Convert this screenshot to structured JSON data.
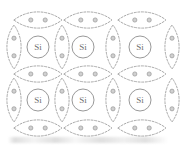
{
  "figure": {
    "kind": "silicon-crystal-lattice-covalent-bond-diagram",
    "width": 187,
    "height": 147,
    "background_color": "#ffffff",
    "line_color": "#9a9a9a",
    "line_style": "dashed",
    "atom_outline_color": "#8d8d8d",
    "electron_fill_color": "#d0d0d0",
    "electron_stroke_color": "#8a8a8a",
    "label_color": "#6f6f6f"
  },
  "atoms": [
    {
      "label": "Si",
      "cx": 38,
      "cy": 47,
      "r": 11,
      "row": 0,
      "col": 0
    },
    {
      "label": "Si",
      "cx": 83,
      "cy": 47,
      "r": 11,
      "row": 0,
      "col": 1
    },
    {
      "label": "Si",
      "cx": 140,
      "cy": 47,
      "r": 11,
      "row": 0,
      "col": 2
    },
    {
      "label": "Si",
      "cx": 38,
      "cy": 100,
      "r": 11,
      "row": 1,
      "col": 0
    },
    {
      "label": "Si",
      "cx": 83,
      "cy": 100,
      "r": 11,
      "row": 1,
      "col": 1
    },
    {
      "label": "Si",
      "cx": 140,
      "cy": 100,
      "r": 11,
      "row": 1,
      "col": 2
    }
  ],
  "horizontal_bonds": [
    {
      "cx": 38,
      "cy": 20,
      "rx": 24,
      "ry": 8,
      "electrons": 2,
      "row": "top"
    },
    {
      "cx": 88,
      "cy": 20,
      "rx": 24,
      "ry": 8,
      "electrons": 2,
      "row": "top"
    },
    {
      "cx": 142,
      "cy": 20,
      "rx": 24,
      "ry": 8,
      "electrons": 2,
      "row": "top"
    },
    {
      "cx": 38,
      "cy": 74,
      "rx": 24,
      "ry": 8,
      "electrons": 2,
      "row": "middle"
    },
    {
      "cx": 88,
      "cy": 74,
      "rx": 24,
      "ry": 8,
      "electrons": 2,
      "row": "middle"
    },
    {
      "cx": 142,
      "cy": 74,
      "rx": 24,
      "ry": 8,
      "electrons": 2,
      "row": "middle"
    },
    {
      "cx": 38,
      "cy": 128,
      "rx": 24,
      "ry": 8,
      "electrons": 2,
      "row": "bottom"
    },
    {
      "cx": 88,
      "cy": 128,
      "rx": 24,
      "ry": 8,
      "electrons": 2,
      "row": "bottom"
    },
    {
      "cx": 142,
      "cy": 128,
      "rx": 24,
      "ry": 8,
      "electrons": 2,
      "row": "bottom"
    }
  ],
  "vertical_bonds": [
    {
      "cx": 14,
      "cy": 47,
      "rx": 7,
      "ry": 22,
      "electrons": 2,
      "col": "left-edge"
    },
    {
      "cx": 62,
      "cy": 47,
      "rx": 7,
      "ry": 22,
      "electrons": 2,
      "col": "inner-1"
    },
    {
      "cx": 113,
      "cy": 47,
      "rx": 7,
      "ry": 22,
      "electrons": 2,
      "col": "inner-2"
    },
    {
      "cx": 172,
      "cy": 47,
      "rx": 7,
      "ry": 22,
      "electrons": 2,
      "col": "right-edge"
    },
    {
      "cx": 14,
      "cy": 100,
      "rx": 7,
      "ry": 22,
      "electrons": 2,
      "col": "left-edge"
    },
    {
      "cx": 62,
      "cy": 100,
      "rx": 7,
      "ry": 22,
      "electrons": 2,
      "col": "inner-1"
    },
    {
      "cx": 113,
      "cy": 100,
      "rx": 7,
      "ry": 22,
      "electrons": 2,
      "col": "inner-2"
    },
    {
      "cx": 172,
      "cy": 100,
      "rx": 7,
      "ry": 22,
      "electrons": 2,
      "col": "right-edge"
    }
  ],
  "junctions": [
    {
      "x": 14,
      "y": 20
    },
    {
      "x": 62,
      "y": 20
    },
    {
      "x": 113,
      "y": 20
    },
    {
      "x": 172,
      "y": 20
    },
    {
      "x": 14,
      "y": 74
    },
    {
      "x": 62,
      "y": 74
    },
    {
      "x": 113,
      "y": 74
    },
    {
      "x": 172,
      "y": 74
    },
    {
      "x": 14,
      "y": 128
    },
    {
      "x": 62,
      "y": 128
    },
    {
      "x": 113,
      "y": 128
    },
    {
      "x": 172,
      "y": 128
    }
  ]
}
